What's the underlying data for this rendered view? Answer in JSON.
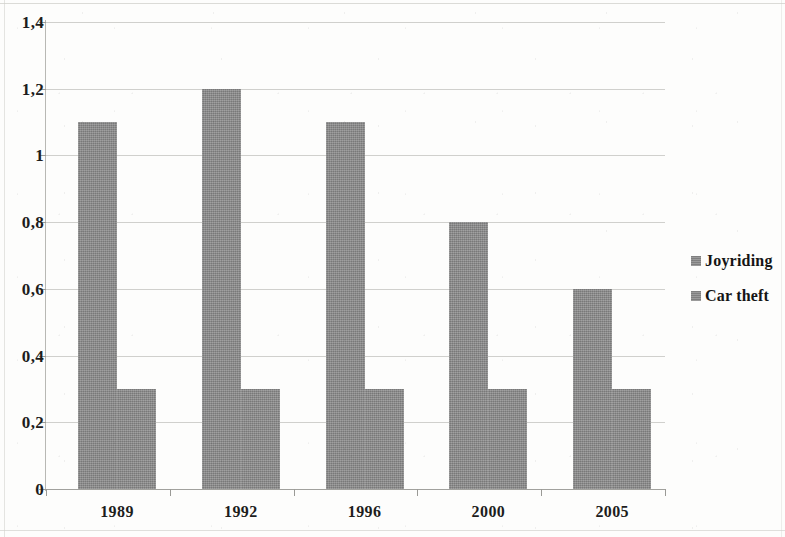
{
  "chart_data": {
    "type": "bar",
    "title": "",
    "subtitle": "",
    "xlabel": "",
    "ylabel": "",
    "categories": [
      "1989",
      "1992",
      "1996",
      "2000",
      "2005"
    ],
    "series": [
      {
        "name": "Joyriding",
        "values": [
          1.1,
          1.2,
          1.1,
          0.8,
          0.6
        ],
        "color": "#8a8a8a"
      },
      {
        "name": "Car theft",
        "values": [
          0.3,
          0.3,
          0.3,
          0.3,
          0.3
        ],
        "color": "#8a8a8a"
      }
    ],
    "ylim": [
      0,
      1.4
    ],
    "ytick_values": [
      0,
      0.2,
      0.4,
      0.6,
      0.8,
      1.0,
      1.2,
      1.4
    ],
    "ytick_labels": [
      "0",
      "0,2",
      "0,4",
      "0,6",
      "0,8",
      "1",
      "1,2",
      "1,4"
    ],
    "decimal_separator": ",",
    "grid": {
      "horizontal": true,
      "vertical": false,
      "color": "#c8c8c4"
    },
    "legend": {
      "position": "right",
      "orientation": "vertical",
      "marker": "square"
    },
    "plot_background": "#ffffff",
    "annotations": []
  },
  "legend": {
    "entries": [
      {
        "label": "Joyriding",
        "swatch_name": "legend-swatch-joyriding"
      },
      {
        "label": "Car theft",
        "swatch_name": "legend-swatch-car-theft"
      }
    ]
  }
}
